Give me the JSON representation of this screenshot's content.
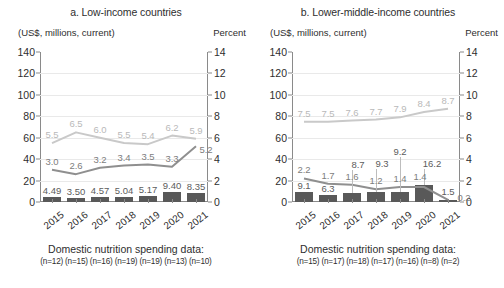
{
  "chart_data": [
    {
      "type": "bar",
      "title": "a. Low-income countries",
      "ylabel": "(US$, millions, current)",
      "y2label": "Percent",
      "xlabel": "",
      "categories": [
        "2015",
        "2016",
        "2017",
        "2018",
        "2019",
        "2020",
        "2021"
      ],
      "ylim": [
        0,
        140
      ],
      "yticks": [
        0,
        20,
        40,
        60,
        80,
        100,
        120,
        140
      ],
      "y2lim": [
        0,
        14
      ],
      "y2ticks": [
        0,
        2,
        4,
        6,
        8,
        10,
        12,
        14
      ],
      "grid": true,
      "legend": "none",
      "series": [
        {
          "name": "Domestic nutrition spending (US$, millions)",
          "type": "bar",
          "axis": "left",
          "color": "#595959",
          "values": [
            4.49,
            3.5,
            4.57,
            5.04,
            5.17,
            9.4,
            8.35
          ],
          "labels": [
            "4.49",
            "3.50",
            "4.57",
            "5.04",
            "5.17",
            "9.40",
            "8.35"
          ]
        },
        {
          "name": "Light gray line (percent)",
          "type": "line",
          "axis": "right",
          "color": "#c9c9c9",
          "values": [
            5.5,
            6.5,
            6.0,
            5.5,
            5.4,
            6.2,
            5.9
          ],
          "labels": [
            "5.5",
            "6.5",
            "6.0",
            "5.5",
            "5.4",
            "6.2",
            "5.9"
          ]
        },
        {
          "name": "Dark gray line (percent)",
          "type": "line",
          "axis": "right",
          "color": "#8f8f8f",
          "values": [
            3.0,
            2.6,
            3.2,
            3.4,
            3.5,
            3.3,
            5.2
          ],
          "labels": [
            "3.0",
            "2.6",
            "3.2",
            "3.4",
            "3.5",
            "3.3",
            "5.2"
          ]
        }
      ],
      "footer_title": "Domestic nutrition spending data:",
      "footer_n": "(n=12) (n=15) (n=16) (n=19) (n=19) (n=13) (n=10)"
    },
    {
      "type": "bar",
      "title": "b. Lower-middle-income countries",
      "ylabel": "(US$, millions, current)",
      "y2label": "Percent",
      "xlabel": "",
      "categories": [
        "2015",
        "2016",
        "2017",
        "2018",
        "2019",
        "2020",
        "2021"
      ],
      "ylim": [
        0,
        140
      ],
      "yticks": [
        0,
        20,
        40,
        60,
        80,
        100,
        120,
        140
      ],
      "y2lim": [
        0,
        14
      ],
      "y2ticks": [
        0,
        2,
        4,
        6,
        8,
        10,
        12,
        14
      ],
      "grid": true,
      "legend": "none",
      "series": [
        {
          "name": "Domestic nutrition spending (US$, millions)",
          "type": "bar",
          "axis": "left",
          "color": "#595959",
          "values": [
            9.1,
            6.3,
            8.7,
            9.3,
            9.2,
            16.2,
            1.5
          ],
          "labels": [
            "9.1",
            "6.3",
            "8.7",
            "9.3",
            "9.2",
            "16.2",
            "1.5"
          ]
        },
        {
          "name": "Light gray line (percent)",
          "type": "line",
          "axis": "right",
          "color": "#c9c9c9",
          "values": [
            7.5,
            7.5,
            7.6,
            7.7,
            7.9,
            8.4,
            8.7
          ],
          "labels": [
            "7.5",
            "7.5",
            "7.6",
            "7.7",
            "7.9",
            "8.4",
            "8.7"
          ]
        },
        {
          "name": "Dark gray line (percent)",
          "type": "line",
          "axis": "right",
          "color": "#8f8f8f",
          "values": [
            2.2,
            1.7,
            1.6,
            1.2,
            1.4,
            1.4,
            0.2
          ],
          "labels": [
            "2.2",
            "1.7",
            "1.6",
            "1.2",
            "1.4",
            "1.4",
            "0.2"
          ]
        }
      ],
      "footer_title": "Domestic nutrition spending data:",
      "footer_n": "(n=15) (n=17) (n=18) (n=17) (n=16) (n=8)  (n=2)"
    }
  ]
}
